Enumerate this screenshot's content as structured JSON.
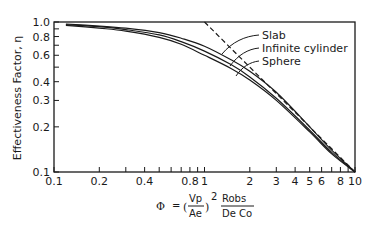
{
  "chart_data": {
    "type": "line",
    "title": "",
    "xlabel": "Φ = (Vp/Ae)^2 · Robs/(De Co)",
    "ylabel": "Effectiveness Factor, η",
    "xscale": "log",
    "yscale": "log",
    "xlim": [
      0.1,
      10
    ],
    "ylim": [
      0.1,
      1.0
    ],
    "grid": false,
    "x_ticks": [
      "0.1",
      "0.2",
      "0.4",
      "0.8",
      "1",
      "2",
      "3",
      "4",
      "5",
      "6",
      "8",
      "10"
    ],
    "y_ticks": [
      "0.1",
      "0.2",
      "0.3",
      "0.4",
      "0.6",
      "0.8",
      "1.0"
    ],
    "series": [
      {
        "name": "Slab",
        "style": "solid",
        "x": [
          0.12,
          0.2,
          0.3,
          0.5,
          0.7,
          1.0,
          1.5,
          2.0,
          3.0,
          5.0,
          7.0,
          10.0
        ],
        "y": [
          0.97,
          0.94,
          0.91,
          0.85,
          0.78,
          0.69,
          0.56,
          0.47,
          0.34,
          0.2,
          0.14,
          0.1
        ]
      },
      {
        "name": "Infinite cylinder",
        "style": "solid",
        "x": [
          0.12,
          0.2,
          0.3,
          0.5,
          0.7,
          1.0,
          1.5,
          2.0,
          3.0,
          5.0,
          7.0,
          10.0
        ],
        "y": [
          0.96,
          0.93,
          0.89,
          0.82,
          0.74,
          0.64,
          0.52,
          0.43,
          0.31,
          0.19,
          0.135,
          0.1
        ]
      },
      {
        "name": "Sphere",
        "style": "solid",
        "x": [
          0.12,
          0.2,
          0.3,
          0.5,
          0.7,
          1.0,
          1.5,
          2.0,
          3.0,
          5.0,
          7.0,
          10.0
        ],
        "y": [
          0.95,
          0.91,
          0.87,
          0.79,
          0.71,
          0.6,
          0.49,
          0.41,
          0.3,
          0.185,
          0.132,
          0.1
        ]
      },
      {
        "name": "Asymptote η = 1/Φ",
        "style": "dashed",
        "x": [
          1.0,
          10.0
        ],
        "y": [
          1.0,
          0.1
        ]
      }
    ],
    "annotations": [
      "Slab",
      "Infinite cylinder",
      "Sphere"
    ],
    "legend_position": "inline labels upper right"
  },
  "labels": {
    "ylabel": "Effectiveness Factor, η",
    "series": [
      "Slab",
      "Infinite cylinder",
      "Sphere"
    ],
    "formula": {
      "phi": "Φ",
      "eq": "=",
      "vp": "Vp",
      "ae": "Ae",
      "exp": "2",
      "robs": "Robs",
      "de_co": "De Co"
    }
  }
}
